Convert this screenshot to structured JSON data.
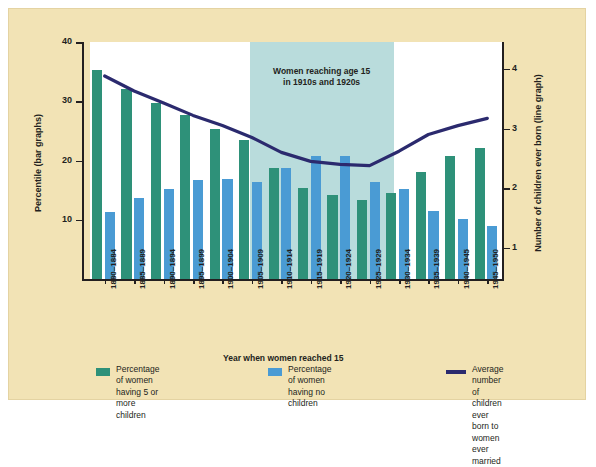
{
  "figure": {
    "background_color": "#f2e3b5",
    "plot_background_color": "#ffffff",
    "highlight_band_color": "#b9dcdc"
  },
  "axes": {
    "left": {
      "title": "Percentile (bar graphs)",
      "ticks": [
        "10",
        "20",
        "30",
        "40"
      ],
      "min": 0,
      "max": 40
    },
    "right": {
      "title": "Number of children ever born (line graph)",
      "ticks": [
        "1",
        "2",
        "3",
        "4"
      ],
      "min": 0.48,
      "max": 4.45
    },
    "x": {
      "title": "Year when women reached 15"
    }
  },
  "annotation": {
    "text": "Women reaching age 15\nin 1910s and 1920s",
    "line1": "Women reaching age 15",
    "line2": "in 1910s and 1920s",
    "band_start_category": "1905-1909",
    "band_end_category": "1925-1929"
  },
  "legend": {
    "items": [
      {
        "name": "legend-green",
        "color": "#2e9179",
        "type": "bar",
        "label": "Percentage of women\nhaving 5 or more children"
      },
      {
        "name": "legend-blue",
        "color": "#4a9bd4",
        "type": "bar",
        "label": "Percentage of women\nhaving no children"
      },
      {
        "name": "legend-line",
        "color": "#2b2a6e",
        "type": "line",
        "label": "Average number of children ever\nborn to women ever married"
      }
    ]
  },
  "chart_data": {
    "type": "bar",
    "title": "",
    "xlabel": "Year when women reached 15",
    "ylabel": "Percentile (bar graphs)",
    "y2label": "Number of children ever born (line graph)",
    "ylim": [
      0,
      40
    ],
    "y2lim": [
      0.48,
      4.45
    ],
    "grid": false,
    "legend_position": "bottom",
    "categories": [
      "1880-1884",
      "1885-1889",
      "1890-1894",
      "1895-1899",
      "1900-1904",
      "1905-1909",
      "1910-1914",
      "1915-1919",
      "1920-1924",
      "1925-1929",
      "1930-1934",
      "1935-1939",
      "1940-1945",
      "1945-1950"
    ],
    "series": [
      {
        "name": "Percentage of women having 5 or more children",
        "type": "bar",
        "color": "#2e9179",
        "axis": "left",
        "values": [
          35.2,
          32.0,
          29.7,
          27.7,
          25.3,
          23.4,
          18.8,
          15.4,
          14.2,
          13.4,
          14.6,
          18.0,
          20.7,
          22.1
        ]
      },
      {
        "name": "Percentage of women having no children",
        "type": "bar",
        "color": "#4a9bd4",
        "axis": "left",
        "values": [
          11.3,
          13.6,
          15.2,
          16.7,
          16.9,
          16.4,
          18.8,
          20.7,
          20.8,
          16.4,
          15.2,
          11.5,
          10.2,
          8.9
        ]
      },
      {
        "name": "Average number of children ever born to women ever married",
        "type": "line",
        "color": "#2b2a6e",
        "axis": "right",
        "values": [
          3.88,
          3.63,
          3.43,
          3.22,
          3.05,
          2.85,
          2.6,
          2.45,
          2.4,
          2.38,
          2.62,
          2.9,
          3.05,
          3.17
        ]
      }
    ]
  }
}
